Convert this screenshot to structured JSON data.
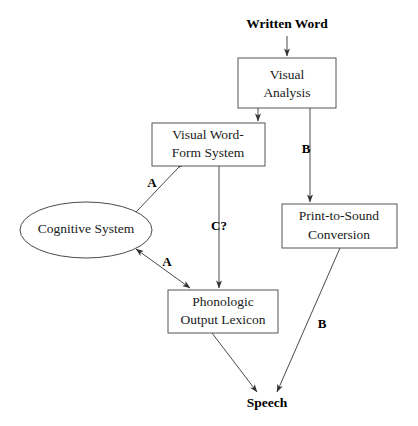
{
  "diagram": {
    "background_color": "#ffffff",
    "line_color": "#4a4a4a",
    "text_color": "#1a1a1a",
    "nodes": [
      {
        "id": "written_word",
        "shape": "text",
        "lines": [
          "Written Word"
        ],
        "bold": true,
        "cx": 287,
        "cy": 25
      },
      {
        "id": "visual_analysis",
        "shape": "rect",
        "lines": [
          "Visual",
          "Analysis"
        ],
        "x": 238,
        "y": 58,
        "w": 98,
        "h": 50
      },
      {
        "id": "visual_word_form_system",
        "shape": "rect",
        "lines": [
          "Visual Word-",
          "Form System"
        ],
        "x": 152,
        "y": 123,
        "w": 113,
        "h": 43
      },
      {
        "id": "cognitive_system",
        "shape": "ellipse",
        "lines": [
          "Cognitive System"
        ],
        "cx": 86,
        "cy": 230,
        "rx": 66,
        "ry": 28
      },
      {
        "id": "print_to_sound_conversion",
        "shape": "rect",
        "lines": [
          "Print-to-Sound",
          "Conversion"
        ],
        "x": 282,
        "y": 204,
        "w": 115,
        "h": 44
      },
      {
        "id": "phonologic_output_lexicon",
        "shape": "rect",
        "lines": [
          "Phonologic",
          "Output Lexicon"
        ],
        "x": 168,
        "y": 290,
        "w": 110,
        "h": 43
      },
      {
        "id": "speech",
        "shape": "text",
        "lines": [
          "Speech"
        ],
        "bold": true,
        "cx": 267,
        "cy": 404
      }
    ],
    "edges": [
      {
        "id": "written-word-to-visual-analysis",
        "from": "written_word",
        "to": "visual_analysis",
        "label": "",
        "arrowheads": "end"
      },
      {
        "id": "visual-analysis-to-visual-word-form-system",
        "from": "visual_analysis",
        "to": "visual_word_form_system",
        "label": "",
        "arrowheads": "end"
      },
      {
        "id": "visual-analysis-to-print-to-sound-conversion",
        "from": "visual_analysis",
        "to": "print_to_sound_conversion",
        "label": "B",
        "label_x": 306,
        "label_y": 150,
        "arrowheads": "end"
      },
      {
        "id": "visual-word-form-system-to-cognitive-system",
        "from": "visual_word_form_system",
        "to": "cognitive_system",
        "label": "A",
        "label_x": 152,
        "label_y": 184,
        "arrowheads": "both"
      },
      {
        "id": "cognitive-system-to-phonologic-output-lexicon",
        "from": "cognitive_system",
        "to": "phonologic_output_lexicon",
        "label": "A",
        "label_x": 167,
        "label_y": 263,
        "arrowheads": "both"
      },
      {
        "id": "visual-word-form-system-to-phonologic-output-lexicon",
        "from": "visual_word_form_system",
        "to": "phonologic_output_lexicon",
        "label": "C?",
        "label_x": 219,
        "label_y": 227,
        "arrowheads": "end"
      },
      {
        "id": "phonologic-output-lexicon-to-speech",
        "from": "phonologic_output_lexicon",
        "to": "speech",
        "label": "",
        "arrowheads": "end"
      },
      {
        "id": "print-to-sound-conversion-to-speech",
        "from": "print_to_sound_conversion",
        "to": "speech",
        "label": "B",
        "label_x": 322,
        "label_y": 325,
        "arrowheads": "end"
      }
    ]
  }
}
